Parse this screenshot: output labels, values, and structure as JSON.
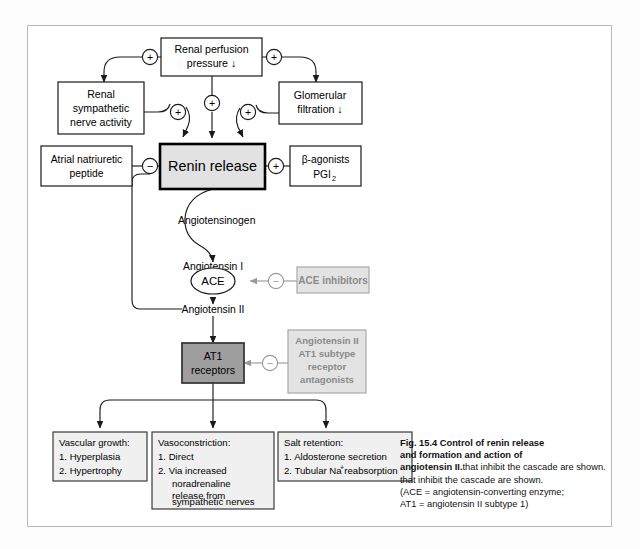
{
  "figure": {
    "id": "Fig. 15.4",
    "title_bold": "Control of renin release and formation and action of angiotensin II.",
    "caption_lines": [
      "Fig. 15.4   Control of renin release",
      "and formation and action of",
      "angiotensin II. Sites of action of drugs",
      "that inhibit the cascade are shown.",
      "(ACE = angiotensin-converting enzyme;",
      "AT1 = angiotensin II subtype 1)"
    ],
    "caption_bold_segments": [
      "Fig. 15.4   Control of renin release",
      "and formation and action of",
      "angiotensin II."
    ],
    "caption_plain_segments": [
      " Sites of action of drugs",
      "that inhibit the cascade are shown.",
      "(ACE = angiotensin-converting enzyme;",
      "AT1 = angiotensin II subtype 1)"
    ]
  },
  "colors": {
    "frame_border": "#b9b9b9",
    "box_border": "#1a1a1a",
    "renin_fill": "#e2e2e2",
    "renin_border": "#000000",
    "at1_fill": "#9e9e9e",
    "at1_border": "#3a3a3a",
    "drug_fill": "#e3e3e3",
    "drug_border": "#a8a8a8",
    "drug_text": "#8a8a8a",
    "outcome_fill": "#f0f0f0",
    "line": "#1a1a1a",
    "drug_line": "#9a9a9a"
  },
  "boxes": {
    "renal_perfusion": {
      "lines": [
        "Renal perfusion",
        "pressure ↓"
      ]
    },
    "renal_sympathetic": {
      "lines": [
        "Renal",
        "sympathetic",
        "nerve activity"
      ]
    },
    "glomerular": {
      "lines": [
        "Glomerular",
        "filtration ↓"
      ]
    },
    "atrial_peptide": {
      "lines": [
        "Atrial natriuretic",
        "peptide"
      ]
    },
    "beta_agonists": {
      "lines": [
        "β-agonists",
        "PGI"
      ],
      "subscript": "2"
    },
    "renin_release": {
      "label": "Renin release"
    },
    "at1_receptors": {
      "lines": [
        "AT1",
        "receptors"
      ]
    },
    "ace_inhibitors": {
      "label": "ACE inhibitors"
    },
    "at1_antagonists": {
      "lines": [
        "Angiotensin II",
        "AT1 subtype",
        "receptor",
        "antagonists"
      ]
    }
  },
  "cascade": {
    "angiotensinogen": "Angiotensinogen",
    "angiotensin_i": "Angiotensin I",
    "ace": "ACE",
    "angiotensin_ii": "Angiotensin II"
  },
  "outcomes": [
    {
      "title": "Vascular growth:",
      "items": [
        "1.  Hyperplasia",
        "2.  Hypertrophy"
      ]
    },
    {
      "title": "Vasoconstriction:",
      "items": [
        "1.  Direct",
        "2.  Via increased",
        "noradrenaline",
        "release from",
        "sympathetic nerves"
      ]
    },
    {
      "title": "Salt retention:",
      "items": [
        "1.  Aldosterone secretion",
        "2.  Tubular Na  reabsorption"
      ],
      "superscript": "+"
    }
  ],
  "signs": {
    "plus": "+",
    "minus": "−",
    "plus_nodes": 5,
    "minus_nodes": 3
  }
}
